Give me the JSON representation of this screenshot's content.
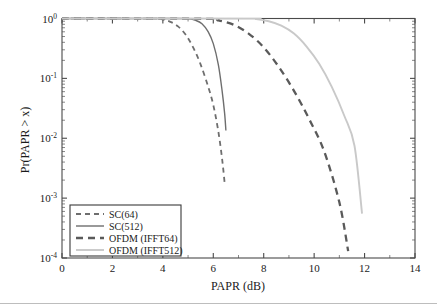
{
  "chart_data": {
    "type": "line",
    "title": "",
    "xlabel": "PAPR (dB)",
    "ylabel": "Pr(PAPR > x)",
    "xlim": [
      0,
      14
    ],
    "ylim": [
      0.0001,
      1
    ],
    "yscale": "log",
    "xscale": "linear",
    "grid": false,
    "legend_position": "lower left",
    "xticks": [
      0,
      2,
      4,
      6,
      8,
      10,
      12,
      14
    ],
    "xtick_labels": [
      "0",
      "2",
      "4",
      "6",
      "8",
      "10",
      "12",
      "14"
    ],
    "ytick_labels": [
      "10",
      "10",
      "10",
      "10",
      "10"
    ],
    "ytick_exponents": [
      "0",
      "-1",
      "-2",
      "-3",
      "-4"
    ],
    "ytick_values": [
      1,
      0.1,
      0.01,
      0.001,
      0.0001
    ],
    "series": [
      {
        "name": "SC(64)",
        "style": "dashed",
        "color": "#6e6e6e",
        "width": 1.8,
        "dash": "5,4",
        "x": [
          0.0,
          3.6,
          4.0,
          4.3,
          4.6,
          4.9,
          5.2,
          5.5,
          5.8,
          6.0,
          6.2,
          6.35,
          6.45
        ],
        "y": [
          1.0,
          0.995,
          0.96,
          0.88,
          0.74,
          0.54,
          0.33,
          0.17,
          0.072,
          0.036,
          0.013,
          0.0045,
          0.0018
        ]
      },
      {
        "name": "SC(512)",
        "style": "solid",
        "color": "#6e6e6e",
        "width": 1.4,
        "dash": "",
        "x": [
          0.0,
          4.6,
          5.0,
          5.3,
          5.55,
          5.8,
          6.0,
          6.2,
          6.35,
          6.45,
          6.5
        ],
        "y": [
          1.0,
          0.999,
          0.985,
          0.93,
          0.82,
          0.6,
          0.38,
          0.17,
          0.062,
          0.026,
          0.0135
        ]
      },
      {
        "name": "OFDM (IFFT64)",
        "style": "dashed",
        "color": "#5a5a5a",
        "width": 2.3,
        "dash": "7,5",
        "x": [
          0.0,
          5.6,
          6.2,
          6.8,
          7.4,
          8.0,
          8.6,
          9.2,
          9.8,
          10.4,
          11.0,
          11.35
        ],
        "y": [
          1.0,
          0.99,
          0.93,
          0.79,
          0.56,
          0.33,
          0.155,
          0.062,
          0.021,
          0.006,
          0.00085,
          0.00013
        ]
      },
      {
        "name": "OFDM (IFFT512)",
        "style": "solid",
        "color": "#c9c9c9",
        "width": 1.9,
        "dash": "",
        "x": [
          0.0,
          7.2,
          7.7,
          8.2,
          8.7,
          9.2,
          9.7,
          10.2,
          10.7,
          11.2,
          11.6,
          11.9
        ],
        "y": [
          1.0,
          0.997,
          0.975,
          0.9,
          0.76,
          0.56,
          0.34,
          0.175,
          0.072,
          0.0235,
          0.0075,
          0.00055
        ]
      }
    ]
  },
  "legend": {
    "entries": [
      {
        "label": "SC(64)"
      },
      {
        "label": "SC(512)"
      },
      {
        "label": "OFDM (IFFT64)"
      },
      {
        "label": "OFDM (IFFT512)"
      }
    ]
  },
  "axes": {
    "x_title": "PAPR (dB)",
    "y_title": "Pr(PAPR > x)"
  }
}
